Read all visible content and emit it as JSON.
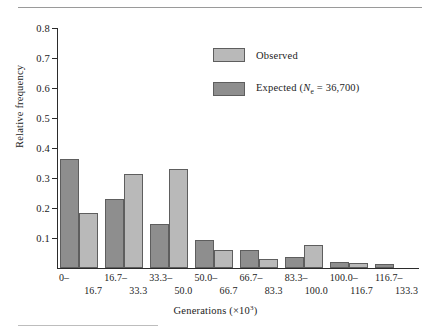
{
  "chart_data": {
    "type": "bar",
    "title": "",
    "xlabel": "Generations (×10³)",
    "ylabel": "Relative frequency",
    "ylim": [
      0,
      0.8
    ],
    "ytick_labels": [
      "0.8",
      "0.7",
      "0.6",
      "0.5",
      "0.4",
      "0.3",
      "0.2",
      "0.1"
    ],
    "ytick_values": [
      0.8,
      0.7,
      0.6,
      0.5,
      0.4,
      0.3,
      0.2,
      0.1
    ],
    "grid": false,
    "legend_position": "upper center-right",
    "categories": [
      "0– 16.7",
      "16.7– 33.3",
      "33.3– 50.0",
      "50.0– 66.7",
      "66.7– 83.3",
      "83.3– 100.0",
      "100.0– 116.7",
      "116.7– 133.3"
    ],
    "category_lines": [
      {
        "lower": "0–",
        "upper": "16.7"
      },
      {
        "lower": "16.7–",
        "upper": "33.3"
      },
      {
        "lower": "33.3–",
        "upper": "50.0"
      },
      {
        "lower": "50.0–",
        "upper": "66.7"
      },
      {
        "lower": "66.7–",
        "upper": "83.3"
      },
      {
        "lower": "83.3–",
        "upper": "100.0"
      },
      {
        "lower": "100.0–",
        "upper": "116.7"
      },
      {
        "lower": "116.7–",
        "upper": "133.3"
      }
    ],
    "series": [
      {
        "name": "Expected (Ne = 36,700)",
        "legend_label_prefix": "Expected (",
        "legend_label_var": "N",
        "legend_label_sub": "e",
        "legend_label_suffix": " = 36,700)",
        "color": "#8e8e8e",
        "draw_order": 1,
        "values": [
          0.365,
          0.231,
          0.148,
          0.094,
          0.06,
          0.037,
          0.021,
          0.015
        ]
      },
      {
        "name": "Observed",
        "legend_label": "Observed",
        "color": "#b9b9b9",
        "draw_order": 2,
        "values": [
          0.183,
          0.313,
          0.329,
          0.061,
          0.031,
          0.077,
          0.016,
          0.0
        ]
      }
    ]
  },
  "colors": {
    "observed": "#b9b9b9",
    "expected": "#8e8e8e",
    "bar_edge": "#5e5e5e",
    "axis": "#2b2b2b",
    "rule": "#9a9a9a"
  }
}
